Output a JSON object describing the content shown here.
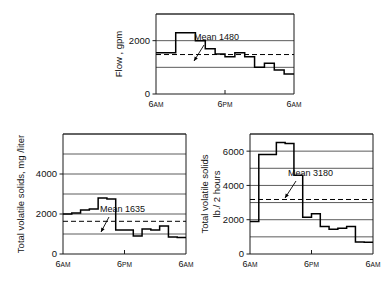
{
  "figure": {
    "background": "#ffffff",
    "ink_color": "#000000",
    "chart_count": 3
  },
  "chart_data": [
    {
      "id": "flow-chart",
      "type": "line",
      "style": "step",
      "title": "",
      "xlabel": "",
      "ylabel": "Flow , gpm",
      "ylabel_lines": [
        "Flow , gpm"
      ],
      "xlim": [
        0,
        24
      ],
      "ylim": [
        0,
        3000
      ],
      "yticks": [
        0,
        2000
      ],
      "ytick_labels": [
        "0",
        "2000"
      ],
      "gridlines": [
        1000,
        2000,
        3000
      ],
      "grid": true,
      "xticks": [
        0,
        12,
        24
      ],
      "xtick_labels": [
        "6AM",
        "6PM",
        "6AM"
      ],
      "xtick_label_parts": [
        {
          "value": "6",
          "suffix": "AM"
        },
        {
          "value": "6",
          "suffix": "PM"
        },
        {
          "value": "6",
          "suffix": "AM"
        }
      ],
      "mean_value": 1480,
      "mean_label": "Mean 1480",
      "x": [
        0,
        2,
        4,
        6,
        8,
        10,
        12,
        14,
        16,
        18,
        20,
        22,
        24
      ],
      "values": [
        1550,
        1550,
        2300,
        2300,
        2000,
        1700,
        1500,
        1400,
        1550,
        1400,
        1000,
        1150,
        900,
        750
      ]
    },
    {
      "id": "tvs-concentration-chart",
      "type": "line",
      "style": "step",
      "title": "",
      "xlabel": "",
      "ylabel": "Total volatile solids, mg /liter",
      "ylabel_lines": [
        "Total volatile solids, mg /liter"
      ],
      "xlim": [
        0,
        24
      ],
      "ylim": [
        0,
        6000
      ],
      "yticks": [
        0,
        2000,
        4000
      ],
      "ytick_labels": [
        "0",
        "2000",
        "4000"
      ],
      "gridlines": [
        1000,
        2000,
        3000,
        4000,
        5000,
        6000
      ],
      "grid": true,
      "xticks": [
        0,
        12,
        24
      ],
      "xtick_labels": [
        "6AM",
        "6PM",
        "6AM"
      ],
      "xtick_label_parts": [
        {
          "value": "6",
          "suffix": "AM"
        },
        {
          "value": "6",
          "suffix": "PM"
        },
        {
          "value": "6",
          "suffix": "AM"
        }
      ],
      "mean_value": 1635,
      "mean_label": "Mean 1635",
      "x": [
        0,
        2,
        4,
        6,
        8,
        10,
        12,
        14,
        16,
        18,
        20,
        22,
        24
      ],
      "values": [
        2000,
        2050,
        2200,
        2250,
        2800,
        2750,
        1200,
        1200,
        900,
        1250,
        1200,
        1400,
        850,
        820
      ]
    },
    {
      "id": "tvs-load-chart",
      "type": "line",
      "style": "step",
      "title": "",
      "xlabel": "",
      "ylabel": "Total volatile solids lb./2 hours",
      "ylabel_lines": [
        "Total volatile solids",
        "lb./ 2 hours"
      ],
      "xlim": [
        0,
        24
      ],
      "ylim": [
        0,
        7000
      ],
      "yticks": [
        0,
        2000,
        4000,
        6000
      ],
      "ytick_labels": [
        "0",
        "2000",
        "4000",
        "6000"
      ],
      "gridlines": [
        1000,
        2000,
        3000,
        4000,
        5000,
        6000,
        7000
      ],
      "grid": true,
      "xticks": [
        0,
        12,
        24
      ],
      "xtick_labels": [
        "6AM",
        "6PM",
        "6AM"
      ],
      "xtick_label_parts": [
        {
          "value": "6",
          "suffix": "AM"
        },
        {
          "value": "6",
          "suffix": "PM"
        },
        {
          "value": "6",
          "suffix": "AM"
        }
      ],
      "mean_value": 3180,
      "mean_label": "Mean 3180",
      "x": [
        0,
        2,
        4,
        6,
        8,
        10,
        12,
        14,
        16,
        18,
        20,
        22,
        24
      ],
      "values": [
        1900,
        5800,
        5800,
        6500,
        6450,
        4600,
        2150,
        2350,
        1600,
        1450,
        1500,
        1600,
        700,
        680
      ]
    }
  ]
}
